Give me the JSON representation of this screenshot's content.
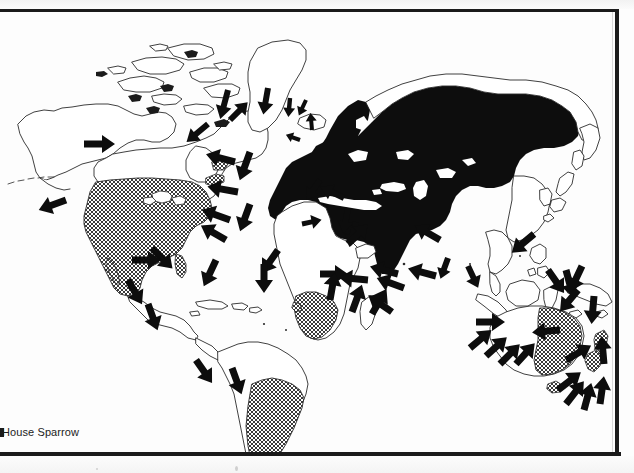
{
  "figure": {
    "caption": "House Sparrow",
    "subject": "House Sparrow",
    "map_type": "world distribution map",
    "projection": "world equirectangular-style outline"
  },
  "legend_semantics": {
    "solid_black_fill": "native breeding range",
    "cross_hatched_fill": "introduced / established range",
    "black_arrows": "introduction and spread routes"
  },
  "colors": {
    "ink": "#111111",
    "frame": "#1b1b1b",
    "coastline": "#2a2a2a",
    "paper": "#fdfdfd",
    "hatch": "#333333"
  },
  "ranges": {
    "native": [
      "Europe",
      "North Africa",
      "Middle East",
      "Russia / Siberia",
      "Central Asia",
      "India",
      "Myanmar"
    ],
    "introduced": [
      "North America",
      "southern South America",
      "southern Africa",
      "eastern Australia",
      "New Zealand"
    ]
  },
  "landmasses": [
    {
      "name": "alaska",
      "label": "Alaska"
    },
    {
      "name": "canada",
      "label": "Canada"
    },
    {
      "name": "greenland",
      "label": "Greenland"
    },
    {
      "name": "united-states",
      "label": "United States"
    },
    {
      "name": "mexico",
      "label": "Mexico"
    },
    {
      "name": "central-america",
      "label": "Central America"
    },
    {
      "name": "caribbean",
      "label": "Caribbean"
    },
    {
      "name": "south-america",
      "label": "South America"
    },
    {
      "name": "iceland",
      "label": "Iceland"
    },
    {
      "name": "british-isles",
      "label": "British Isles"
    },
    {
      "name": "europe",
      "label": "Europe"
    },
    {
      "name": "africa",
      "label": "Africa"
    },
    {
      "name": "madagascar",
      "label": "Madagascar"
    },
    {
      "name": "asia",
      "label": "Asia"
    },
    {
      "name": "japan",
      "label": "Japan"
    },
    {
      "name": "southeast-asia",
      "label": "Southeast Asia"
    },
    {
      "name": "indonesia",
      "label": "Indonesia"
    },
    {
      "name": "philippines",
      "label": "Philippines"
    },
    {
      "name": "new-guinea",
      "label": "New Guinea"
    },
    {
      "name": "australia",
      "label": "Australia"
    },
    {
      "name": "new-zealand",
      "label": "New Zealand"
    }
  ],
  "arrow_count": 48
}
